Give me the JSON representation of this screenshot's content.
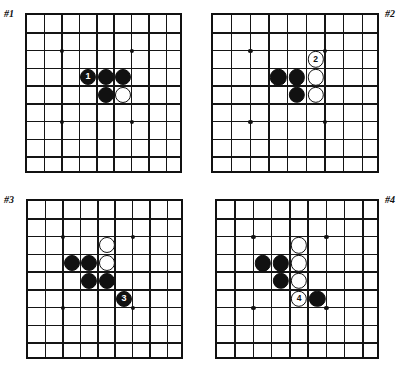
{
  "figure": {
    "kind": "go-problem-diagrams",
    "board_size_cells": 9,
    "panel_count": 4
  },
  "colors": {
    "ink": "#111111",
    "paper": "#ffffff",
    "black_stone": "#111111",
    "white_stone": "#ffffff"
  },
  "panels": [
    {
      "id": "panel-1",
      "label": "#1",
      "label_side": "left",
      "stones": [
        {
          "color": "black",
          "col": 3,
          "row": 3,
          "marker": "1",
          "move": true
        },
        {
          "color": "black",
          "col": 4,
          "row": 3,
          "marker": "",
          "move": false
        },
        {
          "color": "black",
          "col": 5,
          "row": 3,
          "marker": "",
          "move": false
        },
        {
          "color": "black",
          "col": 4,
          "row": 4,
          "marker": "",
          "move": false
        },
        {
          "color": "white",
          "col": 5,
          "row": 4,
          "marker": "",
          "move": false
        }
      ]
    },
    {
      "id": "panel-2",
      "label": "#2",
      "label_side": "right",
      "stones": [
        {
          "color": "white",
          "col": 5,
          "row": 2,
          "marker": "2",
          "move": true
        },
        {
          "color": "black",
          "col": 3,
          "row": 3,
          "marker": "",
          "move": false
        },
        {
          "color": "black",
          "col": 4,
          "row": 3,
          "marker": "",
          "move": false
        },
        {
          "color": "white",
          "col": 5,
          "row": 3,
          "marker": "",
          "move": false
        },
        {
          "color": "black",
          "col": 4,
          "row": 4,
          "marker": "",
          "move": false
        },
        {
          "color": "white",
          "col": 5,
          "row": 4,
          "marker": "",
          "move": false
        }
      ]
    },
    {
      "id": "panel-3",
      "label": "#3",
      "label_side": "left",
      "stones": [
        {
          "color": "white",
          "col": 4,
          "row": 2,
          "marker": "",
          "move": false
        },
        {
          "color": "black",
          "col": 2,
          "row": 3,
          "marker": "",
          "move": false
        },
        {
          "color": "black",
          "col": 3,
          "row": 3,
          "marker": "",
          "move": false
        },
        {
          "color": "white",
          "col": 4,
          "row": 3,
          "marker": "",
          "move": false
        },
        {
          "color": "black",
          "col": 3,
          "row": 4,
          "marker": "",
          "move": false
        },
        {
          "color": "black",
          "col": 4,
          "row": 4,
          "marker": "",
          "move": false
        },
        {
          "color": "black",
          "col": 5,
          "row": 5,
          "marker": "3",
          "move": true
        }
      ]
    },
    {
      "id": "panel-4",
      "label": "#4",
      "label_side": "right",
      "stones": [
        {
          "color": "white",
          "col": 4,
          "row": 2,
          "marker": "",
          "move": false
        },
        {
          "color": "black",
          "col": 2,
          "row": 3,
          "marker": "",
          "move": false
        },
        {
          "color": "black",
          "col": 3,
          "row": 3,
          "marker": "",
          "move": false
        },
        {
          "color": "white",
          "col": 4,
          "row": 3,
          "marker": "",
          "move": false
        },
        {
          "color": "black",
          "col": 3,
          "row": 4,
          "marker": "",
          "move": false
        },
        {
          "color": "white",
          "col": 4,
          "row": 4,
          "marker": "",
          "move": false
        },
        {
          "color": "white",
          "col": 4,
          "row": 5,
          "marker": "4",
          "move": true
        },
        {
          "color": "black",
          "col": 5,
          "row": 5,
          "marker": "",
          "move": false
        }
      ]
    }
  ],
  "star_points": [
    {
      "col": 2,
      "row": 2
    },
    {
      "col": 6,
      "row": 2
    },
    {
      "col": 2,
      "row": 6
    },
    {
      "col": 6,
      "row": 6
    }
  ]
}
